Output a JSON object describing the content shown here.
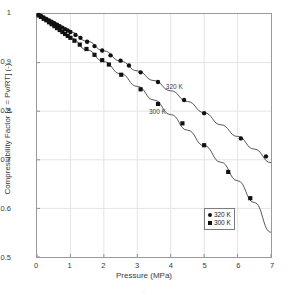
{
  "chart_data": {
    "type": "scatter",
    "title": "",
    "xlabel": "Pressure (MPa)",
    "ylabel": "Compressibility Factor [z = Pv/RT] (-)",
    "xlim": [
      0,
      7
    ],
    "ylim": [
      0.5,
      1.0
    ],
    "xticks": [
      "0",
      "1",
      "2",
      "3",
      "4",
      "5",
      "6",
      "7"
    ],
    "yticks": [
      "0.5",
      "0.6",
      "0.7",
      "0.8",
      "0.9",
      "1"
    ],
    "grid": true,
    "legend_position": "lower-right",
    "marker_color": "#111111",
    "line_color": "#444444",
    "series": [
      {
        "name": "320 K",
        "marker": "circle",
        "annotation": "320 K",
        "points": [
          [
            0.05,
            0.998
          ],
          [
            0.12,
            0.996
          ],
          [
            0.2,
            0.993
          ],
          [
            0.28,
            0.99
          ],
          [
            0.36,
            0.987
          ],
          [
            0.44,
            0.984
          ],
          [
            0.52,
            0.981
          ],
          [
            0.6,
            0.978
          ],
          [
            0.68,
            0.975
          ],
          [
            0.76,
            0.972
          ],
          [
            0.84,
            0.969
          ],
          [
            0.92,
            0.966
          ],
          [
            1.0,
            0.963
          ],
          [
            1.15,
            0.957
          ],
          [
            1.3,
            0.951
          ],
          [
            1.5,
            0.943
          ],
          [
            1.72,
            0.934
          ],
          [
            1.95,
            0.925
          ],
          [
            2.2,
            0.915
          ],
          [
            2.5,
            0.904
          ],
          [
            2.75,
            0.894
          ],
          [
            3.1,
            0.88
          ],
          [
            3.62,
            0.86
          ],
          [
            4.4,
            0.823
          ],
          [
            5.0,
            0.796
          ],
          [
            6.1,
            0.744
          ],
          [
            6.85,
            0.707
          ]
        ]
      },
      {
        "name": "300 K",
        "marker": "square",
        "annotation": "300 K",
        "points": [
          [
            0.05,
            0.997
          ],
          [
            0.12,
            0.994
          ],
          [
            0.2,
            0.99
          ],
          [
            0.28,
            0.987
          ],
          [
            0.36,
            0.983
          ],
          [
            0.44,
            0.979
          ],
          [
            0.52,
            0.975
          ],
          [
            0.6,
            0.971
          ],
          [
            0.68,
            0.967
          ],
          [
            0.76,
            0.963
          ],
          [
            0.84,
            0.959
          ],
          [
            0.92,
            0.955
          ],
          [
            1.0,
            0.951
          ],
          [
            1.12,
            0.945
          ],
          [
            1.28,
            0.937
          ],
          [
            1.48,
            0.928
          ],
          [
            1.72,
            0.916
          ],
          [
            1.95,
            0.905
          ],
          [
            2.15,
            0.896
          ],
          [
            2.52,
            0.875
          ],
          [
            3.1,
            0.845
          ],
          [
            3.62,
            0.815
          ],
          [
            4.35,
            0.775
          ],
          [
            5.0,
            0.73
          ],
          [
            5.72,
            0.675
          ],
          [
            6.38,
            0.621
          ]
        ]
      }
    ],
    "fit_curves": [
      {
        "name": "320 K",
        "path": [
          [
            0.0,
            1.0
          ],
          [
            0.5,
            0.982
          ],
          [
            1.0,
            0.963
          ],
          [
            1.5,
            0.944
          ],
          [
            2.0,
            0.924
          ],
          [
            2.5,
            0.903
          ],
          [
            3.0,
            0.883
          ],
          [
            3.5,
            0.863
          ],
          [
            4.0,
            0.842
          ],
          [
            4.5,
            0.82
          ],
          [
            5.0,
            0.797
          ],
          [
            5.5,
            0.772
          ],
          [
            6.0,
            0.748
          ],
          [
            6.5,
            0.722
          ],
          [
            7.0,
            0.694
          ]
        ]
      },
      {
        "name": "300 K",
        "path": [
          [
            0.0,
            1.0
          ],
          [
            0.5,
            0.976
          ],
          [
            1.0,
            0.951
          ],
          [
            1.5,
            0.926
          ],
          [
            2.0,
            0.902
          ],
          [
            2.5,
            0.877
          ],
          [
            3.0,
            0.851
          ],
          [
            3.5,
            0.823
          ],
          [
            4.0,
            0.793
          ],
          [
            4.5,
            0.761
          ],
          [
            5.0,
            0.729
          ],
          [
            5.5,
            0.695
          ],
          [
            6.0,
            0.657
          ],
          [
            6.5,
            0.612
          ],
          [
            7.0,
            0.551
          ]
        ]
      }
    ],
    "legend": [
      {
        "label": "320 K",
        "marker": "circle"
      },
      {
        "label": "300 K",
        "marker": "square"
      }
    ],
    "annotations": [
      {
        "text": "320 K",
        "x": 3.82,
        "y": 0.852
      },
      {
        "text": "300 K",
        "x": 3.32,
        "y": 0.8
      }
    ]
  },
  "caption_scrap": "."
}
